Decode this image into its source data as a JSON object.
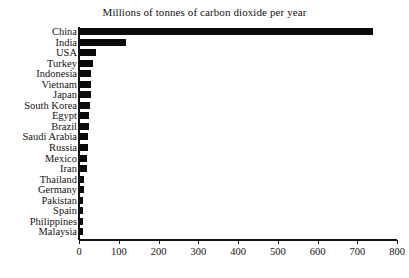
{
  "chart_data": {
    "type": "bar",
    "orientation": "horizontal",
    "title": "Millions of tonnes of carbon dioxide per year",
    "xlabel": "",
    "ylabel": "",
    "xlim": [
      0,
      800
    ],
    "xticks": [
      0,
      100,
      200,
      300,
      400,
      500,
      600,
      700,
      800
    ],
    "xtick_labels": [
      "0",
      "100",
      "200",
      "300",
      "400",
      "500",
      "600",
      "700",
      "800"
    ],
    "grid": false,
    "legend": false,
    "bar_color": "#0b0b0b",
    "background_color": "#ffffff",
    "categories": [
      "China",
      "India",
      "USA",
      "Turkey",
      "Indonesia",
      "Vietnam",
      "Japan",
      "South Korea",
      "Egypt",
      "Brazil",
      "Saudi Arabia",
      "Russia",
      "Mexico",
      "Iran",
      "Thailand",
      "Germany",
      "Pakistan",
      "Spain",
      "Philippines",
      "Malaysia"
    ],
    "values": [
      740,
      118,
      43,
      35,
      30,
      30,
      29,
      28,
      25,
      24,
      23,
      22,
      21,
      20,
      13,
      12,
      11,
      10,
      9,
      9
    ]
  }
}
